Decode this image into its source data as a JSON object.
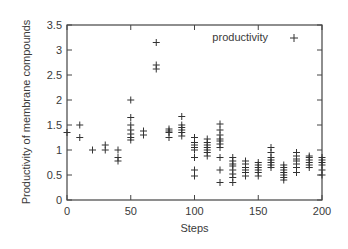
{
  "chart_data": {
    "type": "scatter",
    "title": "",
    "xlabel": "Steps",
    "ylabel": "Productivity of membrane compounds",
    "xlim": [
      0,
      200
    ],
    "ylim": [
      0,
      3.5
    ],
    "x_ticks": [
      0,
      50,
      100,
      150,
      200
    ],
    "x_tick_labels": [
      "0",
      "50",
      "100",
      "150",
      "200"
    ],
    "y_ticks": [
      0,
      0.5,
      1,
      1.5,
      2,
      2.5,
      3,
      3.5
    ],
    "y_tick_labels": [
      "0",
      "0.5",
      "1",
      "1.5",
      "2",
      "2.5",
      "3",
      "3.5"
    ],
    "grid": false,
    "legend_position": "upper right",
    "marker": "+",
    "series": [
      {
        "name": "productivity",
        "color": "#333333",
        "points": [
          [
            0,
            1.35
          ],
          [
            10,
            1.5
          ],
          [
            10,
            1.25
          ],
          [
            20,
            1.0
          ],
          [
            30,
            1.1
          ],
          [
            30,
            1.0
          ],
          [
            40,
            1.0
          ],
          [
            40,
            0.85
          ],
          [
            40,
            0.78
          ],
          [
            50,
            2.0
          ],
          [
            50,
            1.65
          ],
          [
            50,
            1.5
          ],
          [
            50,
            1.4
          ],
          [
            50,
            1.32
          ],
          [
            50,
            1.25
          ],
          [
            50,
            1.2
          ],
          [
            60,
            1.38
          ],
          [
            60,
            1.3
          ],
          [
            70,
            3.15
          ],
          [
            70,
            2.7
          ],
          [
            70,
            2.62
          ],
          [
            80,
            1.42
          ],
          [
            80,
            1.38
          ],
          [
            80,
            1.35
          ],
          [
            80,
            1.25
          ],
          [
            90,
            1.67
          ],
          [
            90,
            1.5
          ],
          [
            90,
            1.45
          ],
          [
            90,
            1.4
          ],
          [
            90,
            1.35
          ],
          [
            90,
            1.28
          ],
          [
            100,
            1.25
          ],
          [
            100,
            1.15
          ],
          [
            100,
            1.1
          ],
          [
            100,
            1.05
          ],
          [
            100,
            1.0
          ],
          [
            100,
            0.85
          ],
          [
            100,
            0.6
          ],
          [
            100,
            0.48
          ],
          [
            110,
            1.22
          ],
          [
            110,
            1.15
          ],
          [
            110,
            1.1
          ],
          [
            110,
            1.05
          ],
          [
            110,
            1.0
          ],
          [
            110,
            0.95
          ],
          [
            110,
            0.88
          ],
          [
            120,
            1.52
          ],
          [
            120,
            1.4
          ],
          [
            120,
            1.3
          ],
          [
            120,
            1.22
          ],
          [
            120,
            1.18
          ],
          [
            120,
            1.12
          ],
          [
            120,
            1.05
          ],
          [
            120,
            0.85
          ],
          [
            120,
            0.6
          ],
          [
            120,
            0.35
          ],
          [
            130,
            0.85
          ],
          [
            130,
            0.78
          ],
          [
            130,
            0.72
          ],
          [
            130,
            0.68
          ],
          [
            130,
            0.6
          ],
          [
            130,
            0.52
          ],
          [
            130,
            0.45
          ],
          [
            130,
            0.35
          ],
          [
            140,
            0.78
          ],
          [
            140,
            0.72
          ],
          [
            140,
            0.65
          ],
          [
            140,
            0.6
          ],
          [
            140,
            0.55
          ],
          [
            140,
            0.48
          ],
          [
            150,
            0.75
          ],
          [
            150,
            0.7
          ],
          [
            150,
            0.65
          ],
          [
            150,
            0.6
          ],
          [
            150,
            0.55
          ],
          [
            150,
            0.48
          ],
          [
            160,
            1.05
          ],
          [
            160,
            0.95
          ],
          [
            160,
            0.85
          ],
          [
            160,
            0.8
          ],
          [
            160,
            0.75
          ],
          [
            160,
            0.7
          ],
          [
            160,
            0.65
          ],
          [
            170,
            0.7
          ],
          [
            170,
            0.65
          ],
          [
            170,
            0.6
          ],
          [
            170,
            0.55
          ],
          [
            170,
            0.5
          ],
          [
            170,
            0.45
          ],
          [
            170,
            0.4
          ],
          [
            180,
            0.95
          ],
          [
            180,
            0.88
          ],
          [
            180,
            0.82
          ],
          [
            180,
            0.78
          ],
          [
            180,
            0.72
          ],
          [
            180,
            0.65
          ],
          [
            180,
            0.55
          ],
          [
            190,
            0.88
          ],
          [
            190,
            0.85
          ],
          [
            190,
            0.8
          ],
          [
            190,
            0.75
          ],
          [
            190,
            0.7
          ],
          [
            190,
            0.65
          ],
          [
            200,
            0.85
          ],
          [
            200,
            0.8
          ],
          [
            200,
            0.75
          ],
          [
            200,
            0.7
          ],
          [
            200,
            0.6
          ],
          [
            200,
            0.5
          ]
        ]
      }
    ]
  }
}
